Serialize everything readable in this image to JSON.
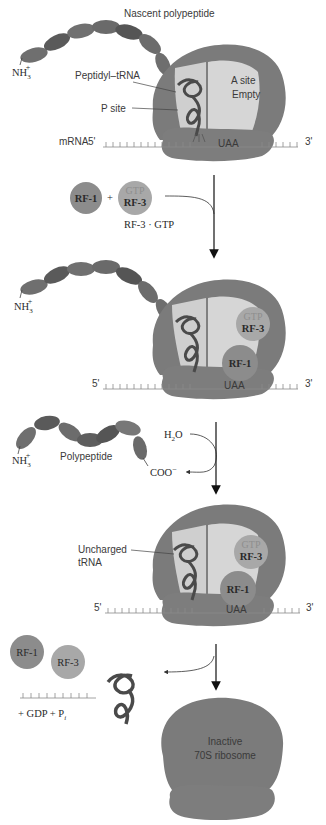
{
  "figure": {
    "colors": {
      "ribosome_dark": "#7b7b7b",
      "ribosome_light": "#cfcfcf",
      "polypeptide_a": "#6f6f6f",
      "polypeptide_b": "#5a5a5a",
      "rf1": "#8c8c8c",
      "rf3": "#a8a8a8",
      "trna": "#4a4a4a",
      "mrna": "#8a8a8a",
      "arrow": "#111111"
    }
  },
  "stage1": {
    "polypeptide_label": "Nascent polypeptide",
    "n_terminus": "NH",
    "n_sub": "3",
    "n_sup": "+",
    "peptidyl_trna_label": "Peptidyl–tRNA",
    "p_site_label": "P site",
    "a_site_line1": "A site",
    "a_site_line2": "Empty",
    "mrna_label": "mRNA",
    "five_prime": "5'",
    "three_prime": "3'",
    "stop_codon": "UAA"
  },
  "step1": {
    "rf1_label": "RF-1",
    "plus": "+",
    "rf3_gtp_label": "GTP",
    "rf3_label": "RF-3",
    "complex_label": "RF-3 · GTP"
  },
  "stage2": {
    "n_terminus": "NH",
    "n_sub": "3",
    "n_sup": "+",
    "rf3_gtp_label": "GTP",
    "rf3_label": "RF-3",
    "rf1_label": "RF-1",
    "five_prime": "5'",
    "three_prime": "3'",
    "stop_codon": "UAA"
  },
  "step2": {
    "water": "H",
    "water_sub": "2",
    "water_o": "O",
    "n_terminus": "NH",
    "n_sub": "3",
    "n_sup": "+",
    "polypeptide_label": "Polypeptide",
    "c_terminus": "COO",
    "c_sup": "−"
  },
  "stage3": {
    "uncharged_line1": "Uncharged",
    "uncharged_line2": "tRNA",
    "rf3_gtp_label": "GTP",
    "rf3_label": "RF-3",
    "rf1_label": "RF-1",
    "five_prime": "5'",
    "three_prime": "3'",
    "stop_codon": "UAA"
  },
  "step3": {
    "rf1_label": "RF-1",
    "rf3_label": "RF-3",
    "products": "+ GDP  + P",
    "pi_sub": "i"
  },
  "stage4": {
    "line1": "Inactive",
    "line2": "70S ribosome"
  }
}
